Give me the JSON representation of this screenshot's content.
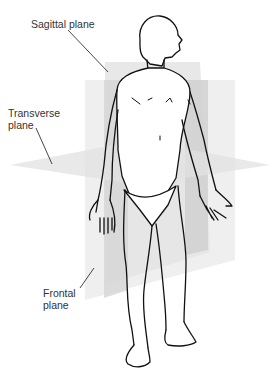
{
  "diagram": {
    "colors": {
      "plane_light": "#eeeeee",
      "plane_mid": "#dedede",
      "plane_dark": "#c8c8c8",
      "outline": "#111111",
      "label_text": "#333333",
      "leader": "#333333"
    },
    "labels": [
      {
        "id": "sagittal",
        "text": "Sagittal plane",
        "lines": [
          "Sagittal plane"
        ]
      },
      {
        "id": "transverse",
        "text": "Transverse plane",
        "lines": [
          "Transverse",
          "plane"
        ]
      },
      {
        "id": "frontal",
        "text": "Frontal plane",
        "lines": [
          "Frontal",
          "plane"
        ]
      }
    ],
    "figure": "Standing human figure in anatomical position, head turned to the right, palms facing forward"
  }
}
